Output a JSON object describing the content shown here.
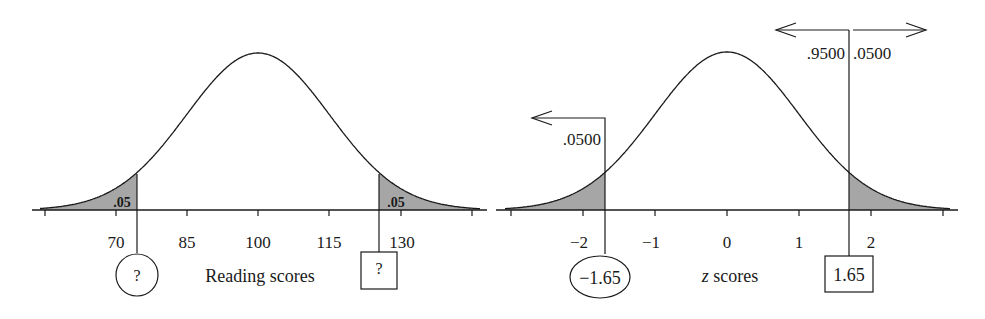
{
  "colors": {
    "ink": "#1a1a1a",
    "shade": "#a6a6a6",
    "background": "#ffffff"
  },
  "chart_data": [
    {
      "type": "area",
      "title": "",
      "xlabel": "Reading scores",
      "ylabel": "",
      "distribution": "normal",
      "mean": 100,
      "sd": 15,
      "xlim": [
        55,
        145
      ],
      "ticks": [
        55,
        70,
        85,
        100,
        115,
        130,
        145
      ],
      "tick_labels": [
        "",
        "70",
        "85",
        "100",
        "115",
        "130",
        ""
      ],
      "shaded_regions": [
        {
          "side": "lower",
          "area_label": ".05",
          "cutoff_label": "?",
          "cutoff_marker": "circle"
        },
        {
          "side": "upper",
          "area_label": ".05",
          "cutoff_label": "?",
          "cutoff_marker": "square"
        }
      ],
      "grid": false,
      "legend": null
    },
    {
      "type": "area",
      "title": "",
      "xlabel": "z scores",
      "xlabel_italic_prefix": "z",
      "xlabel_suffix": " scores",
      "ylabel": "",
      "distribution": "normal",
      "mean": 0,
      "sd": 1,
      "xlim": [
        -3,
        3
      ],
      "ticks": [
        -3,
        -2,
        -1,
        0,
        1,
        2,
        3
      ],
      "tick_labels": [
        "",
        "−2",
        "−1",
        "0",
        "1",
        "2",
        ""
      ],
      "shaded_regions": [
        {
          "side": "lower",
          "cutoff": -1.65,
          "cutoff_label": "−1.65",
          "cutoff_marker": "ellipse",
          "arrow_area_label": ".0500",
          "arrow_direction": "left"
        },
        {
          "side": "upper",
          "cutoff": 1.65,
          "cutoff_label": "1.65",
          "cutoff_marker": "square",
          "arrow_left_label": ".9500",
          "arrow_right_label": ".0500"
        }
      ],
      "grid": false,
      "legend": null
    }
  ],
  "left": {
    "xlabel": "Reading scores",
    "ticks": [
      "70",
      "85",
      "100",
      "115",
      "130"
    ],
    "lower_area": ".05",
    "upper_area": ".05",
    "lower_cutoff": "?",
    "upper_cutoff": "?"
  },
  "right": {
    "xlabel_z": "z",
    "xlabel_rest": " scores",
    "ticks": [
      "−2",
      "−1",
      "0",
      "1",
      "2"
    ],
    "lower_arrow_label": ".0500",
    "upper_left_label": ".9500",
    "upper_right_label": ".0500",
    "lower_cutoff": "−1.65",
    "upper_cutoff": "1.65"
  }
}
